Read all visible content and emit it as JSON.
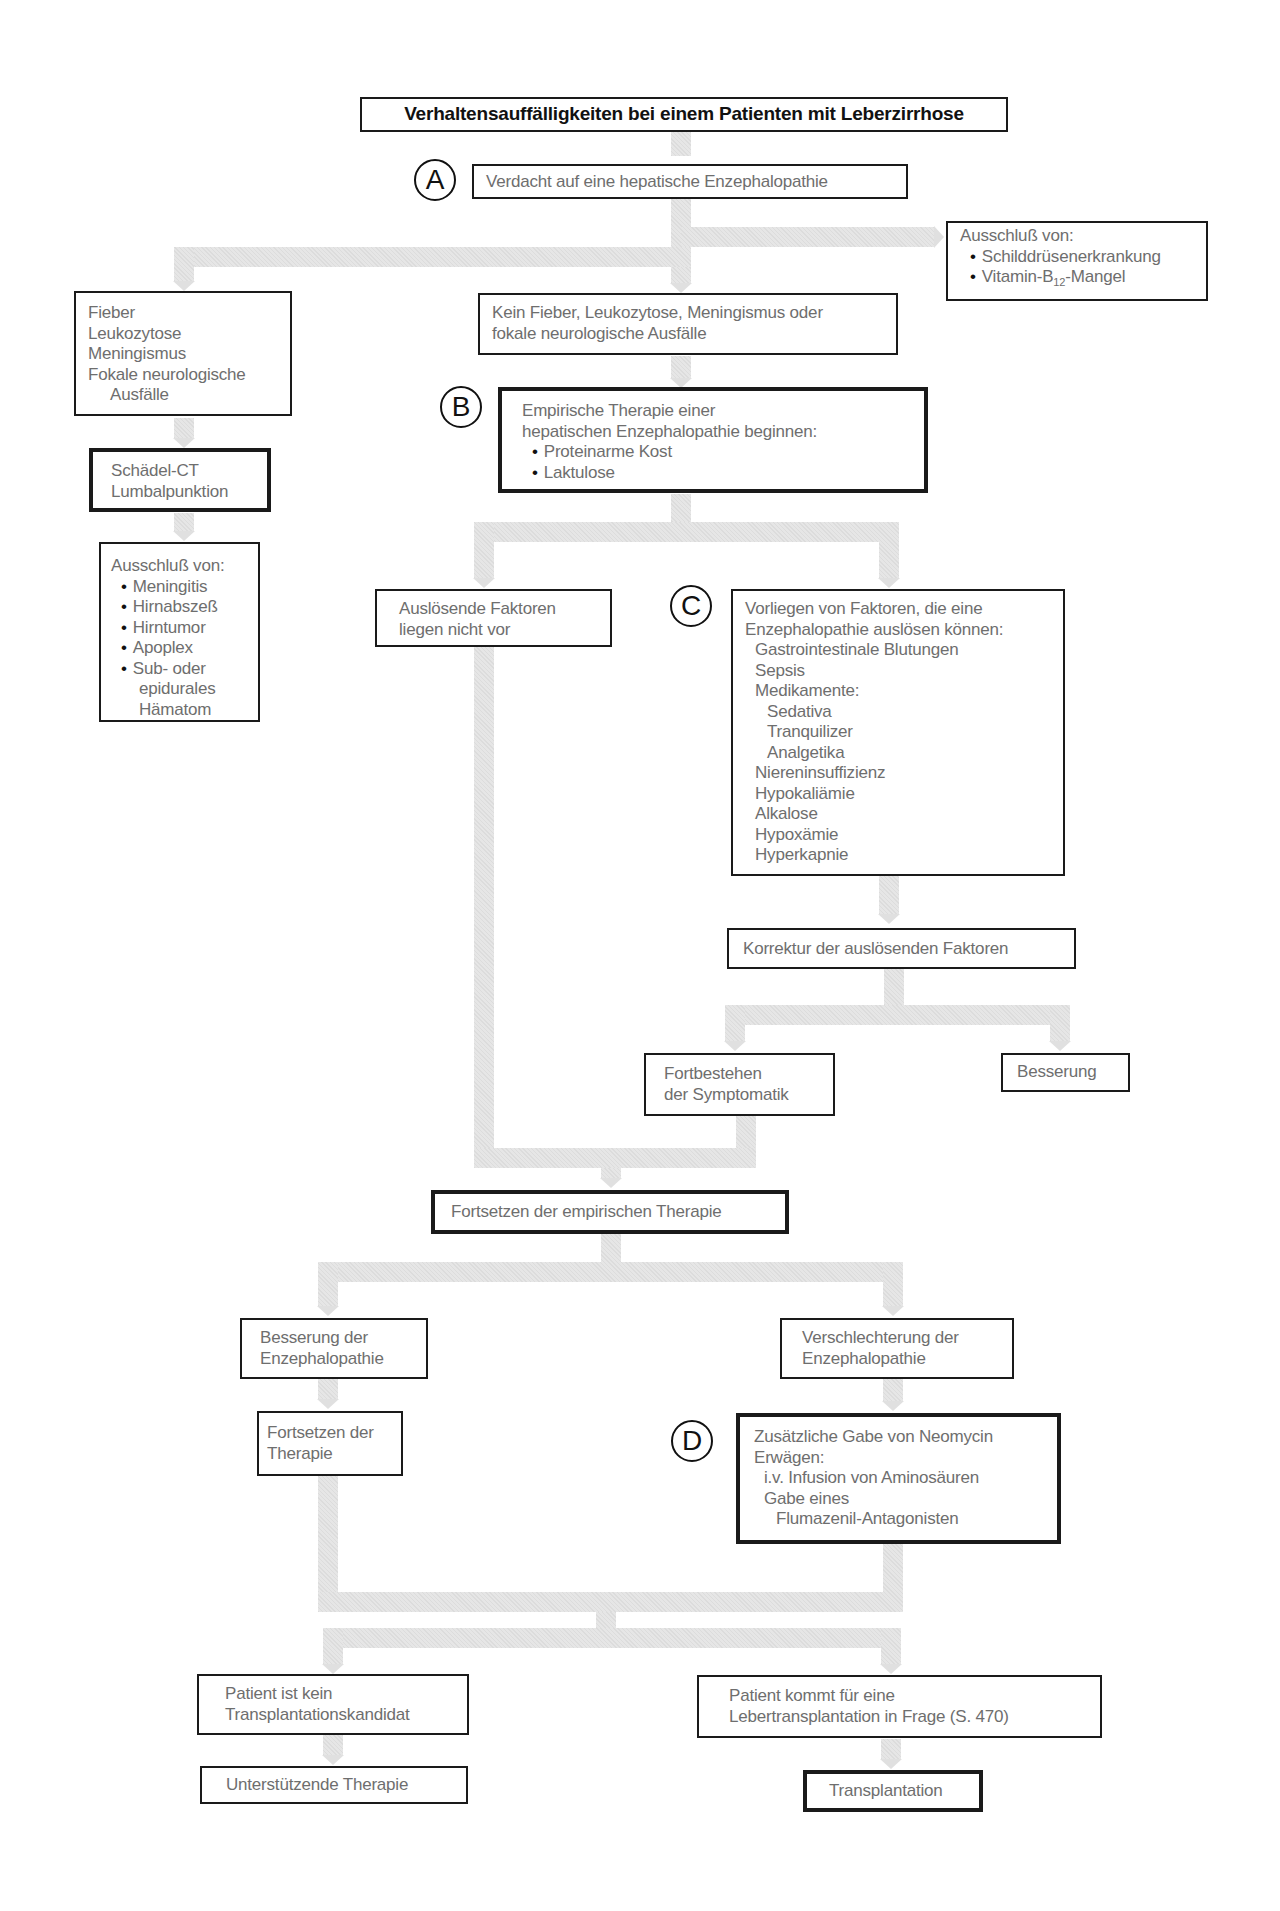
{
  "title": "Verhaltensauffälligkeiten bei einem Patienten mit Leberzirrhose",
  "markers": {
    "a": "A",
    "b": "B",
    "c": "C",
    "d": "D"
  },
  "nodes": {
    "verdacht": "Verdacht auf eine hepatische Enzephalopathie",
    "ausschluss_right": {
      "heading": "Ausschluß von:",
      "items": [
        "Schilddrüsenerkrankung",
        "Vitamin-B",
        "12",
        "-Mangel"
      ]
    },
    "fieber": [
      "Fieber",
      "Leukozytose",
      "Meningismus",
      "Fokale neurologische",
      "Ausfälle"
    ],
    "kein_fieber": [
      "Kein Fieber, Leukozytose, Meningismus oder",
      "fokale neurologische Ausfälle"
    ],
    "empirisch": {
      "lines": [
        "Empirische Therapie einer",
        "hepatischen Enzephalopathie beginnen:"
      ],
      "items": [
        "Proteinarme Kost",
        "Laktulose"
      ]
    },
    "schaedel": [
      "Schädel-CT",
      "Lumbalpunktion"
    ],
    "ausschluss_left": {
      "heading": "Ausschluß von:",
      "items": [
        "Meningitis",
        "Hirnabszeß",
        "Hirntumor",
        "Apoplex",
        "Sub- oder"
      ],
      "continuation": [
        "epidurales",
        "Hämatom"
      ]
    },
    "ausloesende_nicht": [
      "Auslösende Faktoren",
      "liegen nicht vor"
    ],
    "faktoren": {
      "lines": [
        "Vorliegen von Faktoren, die eine",
        "Enzephalopathie auslösen können:"
      ],
      "items": [
        "Gastrointestinale Blutungen",
        "Sepsis",
        "Medikamente:"
      ],
      "medications": [
        "Sedativa",
        "Tranquilizer",
        "Analgetika"
      ],
      "more_items": [
        "Niereninsuffizienz",
        "Hypokaliämie",
        "Alkalose",
        "Hypoxämie",
        "Hyperkapnie"
      ]
    },
    "korrektur": "Korrektur der auslösenden Faktoren",
    "fortbestehen": [
      "Fortbestehen",
      "der Symptomatik"
    ],
    "besserung": "Besserung",
    "fortsetzen_empirisch": "Fortsetzen der empirischen Therapie",
    "besserung_enz": [
      "Besserung der",
      "Enzephalopathie"
    ],
    "verschlechterung_enz": [
      "Verschlechterung der",
      "Enzephalopathie"
    ],
    "fortsetzen_therapie": [
      "Fortsetzen der",
      "Therapie"
    ],
    "neomycin": {
      "lines": [
        "Zusätzliche Gabe von Neomycin",
        "Erwägen:"
      ],
      "items": [
        "i.v. Infusion von Aminosäuren",
        "Gabe eines",
        "Flumazenil-Antagonisten"
      ]
    },
    "kein_kandidat": [
      "Patient ist kein",
      "Transplantationskandidat"
    ],
    "unterstuetzende": "Unterstützende Therapie",
    "kandidat": [
      "Patient kommt für eine",
      "Lebertransplantation in Frage (S. 470)"
    ],
    "transplantation": "Transplantation"
  },
  "colors": {
    "border": "#1a1a1a",
    "text": "#6e6e6e",
    "title_text": "#111111",
    "connector": "#e6e6e6"
  }
}
